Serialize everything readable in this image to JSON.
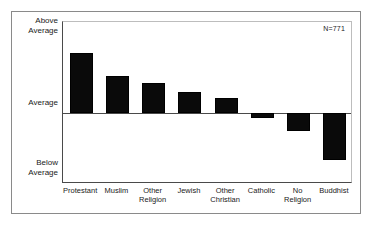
{
  "figure": {
    "annotation": "N=771",
    "axis_labels": {
      "top": "Above\nAverage",
      "middle": "Average",
      "bottom": "Below\nAverage"
    }
  },
  "chart_data": {
    "type": "bar",
    "title": "",
    "subtitle": "",
    "xlabel": "",
    "ylabel": "",
    "annotation": "N=771",
    "grid": false,
    "legend": null,
    "orientation": "vertical",
    "baseline": 0,
    "ytick_labels": [
      "Above Average",
      "Average",
      "Below Average"
    ],
    "ytick_values": [
      1.0,
      0.0,
      -1.0
    ],
    "ylim": [
      -1.0,
      1.28
    ],
    "categories": [
      "Protestant",
      "Muslim",
      "Other Religion",
      "Jewish",
      "Other Christian",
      "Catholic",
      "No Religion",
      "Buddhist"
    ],
    "values": [
      0.85,
      0.52,
      0.42,
      0.3,
      0.21,
      -0.07,
      -0.25,
      -0.66
    ],
    "bar_color": "#0a0a0a"
  }
}
